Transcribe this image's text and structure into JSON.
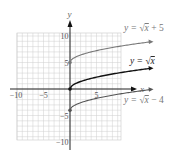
{
  "chart_data": {
    "type": "line",
    "title": "",
    "xlabel": "x",
    "ylabel": "y",
    "xlim": [
      -10,
      10
    ],
    "ylim": [
      -10,
      10
    ],
    "grid": true,
    "x_ticks": [
      {
        "value": -10,
        "label": "−10"
      },
      {
        "value": -5,
        "label": "−5"
      },
      {
        "value": 5,
        "label": "5"
      }
    ],
    "y_ticks": [
      {
        "value": 10,
        "label": "10"
      },
      {
        "value": 5,
        "label": "5"
      },
      {
        "value": -5,
        "label": "−5"
      },
      {
        "value": -10,
        "label": "−10"
      }
    ],
    "series": [
      {
        "name": "y = √x + 5",
        "label_parts": [
          "y = ",
          "√",
          "x",
          " + 5"
        ],
        "color": "#777777",
        "x": [
          0,
          1,
          4,
          9,
          15
        ],
        "y": [
          5,
          6,
          7,
          8,
          8.87
        ],
        "start_point": [
          0,
          5
        ],
        "arrow": true
      },
      {
        "name": "y = √x",
        "label_parts": [
          "y = ",
          "√",
          "x",
          ""
        ],
        "color": "#111111",
        "x": [
          0,
          1,
          4,
          9,
          15
        ],
        "y": [
          0,
          1,
          2,
          3,
          3.87
        ],
        "start_point": [
          0,
          0
        ],
        "arrow": true
      },
      {
        "name": "y = √x − 4",
        "label_parts": [
          "y = ",
          "√",
          "x",
          " − 4"
        ],
        "color": "#555555",
        "x": [
          0,
          1,
          4,
          9,
          15
        ],
        "y": [
          -4,
          -3,
          -2,
          -1,
          -0.13
        ],
        "start_point": [
          0,
          -4
        ],
        "arrow": true
      }
    ]
  },
  "axes": {
    "x_label": "x",
    "y_label": "y"
  }
}
